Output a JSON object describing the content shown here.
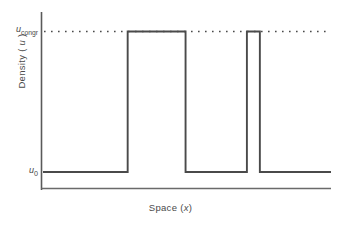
{
  "figure": {
    "background": "#ffffff",
    "line_color": "#4a4a4a",
    "axis_color": "#5a5a5a"
  },
  "labels": {
    "y_axis_title_prefix": "Density ( ",
    "y_axis_title_var": "u",
    "y_axis_title_suffix": " )",
    "x_axis_title_prefix": "Space (",
    "x_axis_title_var": "x",
    "x_axis_title_suffix": ")",
    "tick_high_var": "u",
    "tick_high_sub": "congr",
    "tick_low_var": "u",
    "tick_low_sub": "0"
  },
  "chart_data": {
    "type": "line",
    "subtype": "step-square-wave",
    "title": "",
    "xlabel": "Space (x)",
    "ylabel": "Density ( u )",
    "xlim": [
      0,
      100
    ],
    "ylim": [
      0,
      1.18
    ],
    "grid": false,
    "legend": null,
    "y_tick_values": [
      0.12,
      1.0
    ],
    "y_tick_labels": [
      "u_0",
      "u_congr"
    ],
    "x_tick_values": [],
    "x_tick_labels": [],
    "levels": {
      "u_0": 0.12,
      "u_congr": 1.0
    },
    "reference_lines": [
      {
        "name": "u_congr-dotted-line",
        "orientation": "horizontal",
        "y": 1.0,
        "style": "dotted",
        "x_start": 0,
        "x_end": 100
      }
    ],
    "series": [
      {
        "name": "density-profile",
        "style": "step",
        "color": "#4a4a4a",
        "x": [
          0,
          29.4,
          29.4,
          49.5,
          49.5,
          70.8,
          70.8,
          75.3,
          75.3,
          100
        ],
        "y": [
          0.12,
          0.12,
          1.0,
          1.0,
          0.12,
          0.12,
          1.0,
          1.0,
          0.12,
          0.12
        ],
        "segments": [
          {
            "label": "low-left",
            "x_start": 0.0,
            "x_end": 29.4,
            "level": 0.12
          },
          {
            "label": "high-wide",
            "x_start": 29.4,
            "x_end": 49.5,
            "level": 1.0
          },
          {
            "label": "low-middle",
            "x_start": 49.5,
            "x_end": 70.8,
            "level": 0.12
          },
          {
            "label": "high-narrow",
            "x_start": 70.8,
            "x_end": 75.3,
            "level": 1.0
          },
          {
            "label": "low-right",
            "x_start": 75.3,
            "x_end": 100.0,
            "level": 0.12
          }
        ]
      }
    ]
  }
}
